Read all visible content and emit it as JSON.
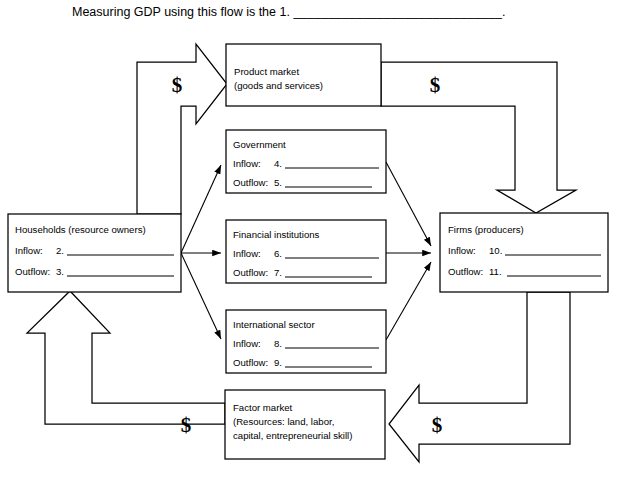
{
  "header": {
    "prompt": "Measuring GDP using this flow is the 1. ______________________________."
  },
  "boxes": {
    "product_market": {
      "name": "Product market",
      "line2": "(goods and services)"
    },
    "government": {
      "name": "Government",
      "inflow_label": "Inflow:",
      "inflow_number": "4.",
      "outflow_label": "Outflow:",
      "outflow_number": "5."
    },
    "households": {
      "name": "Households (resource owners)",
      "inflow_label": "Inflow:",
      "inflow_number": "2.",
      "outflow_label": "Outflow:",
      "outflow_number": "3."
    },
    "financial_institutions": {
      "name": "Financial institutions",
      "inflow_label": "Inflow:",
      "inflow_number": "6.",
      "outflow_label": "Outflow:",
      "outflow_number": "7."
    },
    "international_sector": {
      "name": "International sector",
      "inflow_label": "Inflow:",
      "inflow_number": "8.",
      "outflow_label": "Outflow:",
      "outflow_number": "9."
    },
    "firms": {
      "name": "Firms (producers)",
      "inflow_label": "Inflow:",
      "inflow_number": "10.",
      "outflow_label": "Outflow:",
      "outflow_number": "11."
    },
    "factor_market": {
      "name": "Factor market",
      "line2": "(Resources: land, labor,",
      "line3": "capital, entrepreneurial skill)"
    }
  },
  "flow_arrows": {
    "households_to_product_market": "$",
    "product_market_to_firms": "$",
    "firms_to_factor_market": "$",
    "factor_market_to_households": "$"
  },
  "colors": {
    "stroke": "#000000",
    "fill": "#ffffff",
    "text": "#000000"
  }
}
